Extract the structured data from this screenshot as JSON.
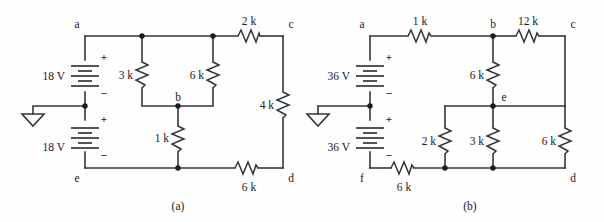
{
  "figure": {
    "type": "circuit-schematic-pair",
    "captions": [
      {
        "id": "cap-a",
        "text": "(a)",
        "x": 178,
        "y": 207
      },
      {
        "id": "cap-b",
        "text": "(b)",
        "x": 470,
        "y": 207
      }
    ]
  },
  "circuit_a": {
    "caption": "(a)",
    "node_labels": [
      {
        "name": "a",
        "text": "a",
        "x": 77,
        "y": 26
      },
      {
        "name": "b",
        "text": "b",
        "x": 178,
        "y": 101
      },
      {
        "name": "c",
        "text": "c",
        "x": 289,
        "y": 26
      },
      {
        "name": "d",
        "text": "d",
        "x": 289,
        "y": 180
      },
      {
        "name": "e",
        "text": "e",
        "x": 77,
        "y": 180
      }
    ],
    "sources": [
      {
        "name": "source-18v-top",
        "label": "18 V",
        "value": 18,
        "unit": "V",
        "label_x": 52,
        "label_y": 76,
        "plus": "+",
        "minus": "–",
        "orientation": "vertical",
        "polarity": "plus-top"
      },
      {
        "name": "source-18v-bottom",
        "label": "18 V",
        "value": 18,
        "unit": "V",
        "label_x": 52,
        "label_y": 147,
        "plus": "+",
        "minus": "–",
        "orientation": "vertical",
        "polarity": "plus-top"
      }
    ],
    "resistors": [
      {
        "name": "r-3k",
        "label": "3 k",
        "value": 3,
        "unit": "k",
        "orientation": "vertical",
        "label_x": 129,
        "label_y": 76
      },
      {
        "name": "r-6k-mid",
        "label": "6 k",
        "value": 6,
        "unit": "k",
        "orientation": "vertical",
        "label_x": 200,
        "label_y": 76
      },
      {
        "name": "r-1k",
        "label": "1 k",
        "value": 1,
        "unit": "k",
        "orientation": "vertical",
        "label_x": 165,
        "label_y": 139
      },
      {
        "name": "r-2k",
        "label": "2 k",
        "value": 2,
        "unit": "k",
        "orientation": "horizontal",
        "label_x": 248,
        "label_y": 22
      },
      {
        "name": "r-4k",
        "label": "4 k",
        "value": 4,
        "unit": "k",
        "orientation": "vertical",
        "label_x": 270,
        "label_y": 106
      },
      {
        "name": "r-6k-bottom",
        "label": "6 k",
        "value": 6,
        "unit": "k",
        "orientation": "horizontal",
        "label_x": 248,
        "label_y": 188
      }
    ],
    "ground": {
      "name": "ground-symbol-a",
      "x": 33,
      "y": 114
    },
    "nodes_dots": [
      {
        "x": 142,
        "y": 36
      },
      {
        "x": 213,
        "y": 36
      },
      {
        "x": 85,
        "y": 106
      },
      {
        "x": 178,
        "y": 106
      },
      {
        "x": 178,
        "y": 168
      }
    ]
  },
  "circuit_b": {
    "caption": "(b)",
    "node_labels": [
      {
        "name": "a",
        "text": "a",
        "x": 362,
        "y": 26
      },
      {
        "name": "b",
        "text": "b",
        "x": 493,
        "y": 26
      },
      {
        "name": "c",
        "text": "c",
        "x": 571,
        "y": 26
      },
      {
        "name": "d",
        "text": "d",
        "x": 571,
        "y": 180
      },
      {
        "name": "e",
        "text": "e",
        "x": 503,
        "y": 101
      },
      {
        "name": "f",
        "text": "f",
        "x": 362,
        "y": 180
      }
    ],
    "sources": [
      {
        "name": "source-36v-top",
        "label": "36 V",
        "value": 36,
        "unit": "V",
        "label_x": 337,
        "label_y": 76,
        "plus": "+",
        "minus": "–",
        "orientation": "vertical",
        "polarity": "plus-top"
      },
      {
        "name": "source-36v-bottom",
        "label": "36 V",
        "value": 36,
        "unit": "V",
        "label_x": 337,
        "label_y": 147,
        "plus": "+",
        "minus": "–",
        "orientation": "vertical",
        "polarity": "plus-top"
      }
    ],
    "resistors": [
      {
        "name": "r-1k",
        "label": "1 k",
        "value": 1,
        "unit": "k",
        "orientation": "horizontal",
        "label_x": 424,
        "label_y": 22
      },
      {
        "name": "r-12k",
        "label": "12 k",
        "value": 12,
        "unit": "k",
        "orientation": "horizontal",
        "label_x": 531,
        "label_y": 22
      },
      {
        "name": "r-6k-vert",
        "label": "6 k",
        "value": 6,
        "unit": "k",
        "orientation": "vertical",
        "label_x": 480,
        "label_y": 76
      },
      {
        "name": "r-2k",
        "label": "2 k",
        "value": 2,
        "unit": "k",
        "orientation": "vertical",
        "label_x": 432,
        "label_y": 143
      },
      {
        "name": "r-3k",
        "label": "3 k",
        "value": 3,
        "unit": "k",
        "orientation": "vertical",
        "label_x": 480,
        "label_y": 143
      },
      {
        "name": "r-6k-right",
        "label": "6 k",
        "value": 6,
        "unit": "k",
        "orientation": "vertical",
        "label_x": 552,
        "label_y": 143
      },
      {
        "name": "r-6k-bottom",
        "label": "6 k",
        "value": 6,
        "unit": "k",
        "orientation": "horizontal",
        "label_x": 404,
        "label_y": 188
      }
    ],
    "ground": {
      "name": "ground-symbol-b",
      "x": 318,
      "y": 114
    },
    "nodes_dots": [
      {
        "x": 493,
        "y": 36
      },
      {
        "x": 370,
        "y": 106
      },
      {
        "x": 493,
        "y": 106
      },
      {
        "x": 445,
        "y": 168
      },
      {
        "x": 493,
        "y": 168
      }
    ]
  }
}
